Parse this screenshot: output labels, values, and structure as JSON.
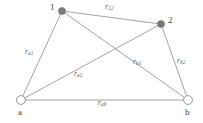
{
  "figure": {
    "background_color": "#ffffff",
    "edge_color": "#8a8a8a",
    "filled_node_color": "#7a7a7a",
    "open_node_stroke": "#8a8a8a",
    "label_color": "#555555"
  },
  "nodes": [
    {
      "id": "n1",
      "label": "1",
      "type": "filled",
      "x": 62,
      "y": 11,
      "r": 3.6,
      "label_x": 50,
      "label_y": 3
    },
    {
      "id": "n2",
      "label": "2",
      "type": "filled",
      "x": 161,
      "y": 24,
      "r": 3.6,
      "label_x": 168,
      "label_y": 16
    },
    {
      "id": "na",
      "label": "a",
      "type": "open",
      "x": 21,
      "y": 100,
      "r": 4.4,
      "label_x": 18,
      "label_y": 108
    },
    {
      "id": "nb",
      "label": "b",
      "type": "open",
      "x": 188,
      "y": 100,
      "r": 4.4,
      "label_x": 185,
      "label_y": 108
    }
  ],
  "edges": [
    {
      "id": "e12",
      "from": "n1",
      "to": "n2",
      "base": "r",
      "sub": "12",
      "label_x": 105,
      "label_y": 3
    },
    {
      "id": "ea1",
      "from": "na",
      "to": "n1",
      "base": "r",
      "sub": "a1",
      "label_x": 25,
      "label_y": 48
    },
    {
      "id": "eb2",
      "from": "nb",
      "to": "n2",
      "base": "r",
      "sub": "b2",
      "label_x": 177,
      "label_y": 57
    },
    {
      "id": "ea2",
      "from": "na",
      "to": "n2",
      "base": "r",
      "sub": "a2",
      "label_x": 74,
      "label_y": 70
    },
    {
      "id": "eb1",
      "from": "nb",
      "to": "n1",
      "base": "r",
      "sub": "b1",
      "label_x": 133,
      "label_y": 58
    },
    {
      "id": "eab",
      "from": "na",
      "to": "nb",
      "base": "r",
      "sub": "ab",
      "label_x": 98,
      "label_y": 99
    }
  ]
}
